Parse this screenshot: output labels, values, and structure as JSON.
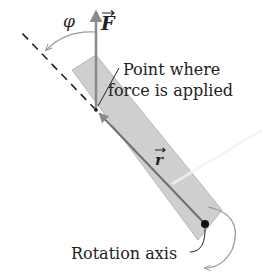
{
  "labels": {
    "phi": "φ",
    "force": "F",
    "point_line1": "Point where",
    "point_line2": "force is applied",
    "r": "r",
    "axis": "Rotation axis"
  },
  "colors": {
    "bar_fill": "#cfcfcf",
    "bar_edge": "#b0b0b0",
    "vector": "#8a8a8a",
    "r_line": "#6f6f6f",
    "text": "#222222",
    "axis_dot": "#111111"
  },
  "icons": {
    "vector_arrow": "vector-arrow-icon"
  }
}
